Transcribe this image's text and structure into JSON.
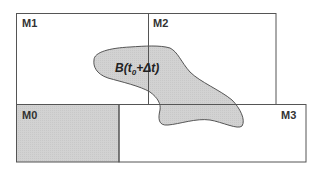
{
  "diagram": {
    "regions": [
      {
        "id": "M1",
        "label": "M1",
        "shaded": false
      },
      {
        "id": "M2",
        "label": "M2",
        "shaded": false
      },
      {
        "id": "M0",
        "label": "M0",
        "shaded": true
      },
      {
        "id": "M3",
        "label": "M3",
        "shaded": false
      }
    ],
    "blob": {
      "label_main": "B(t",
      "label_sub": "0",
      "label_tail": "+Δt)"
    },
    "colors": {
      "border": "#555555",
      "shade": "#d4d4d4",
      "background": "#ffffff"
    }
  }
}
